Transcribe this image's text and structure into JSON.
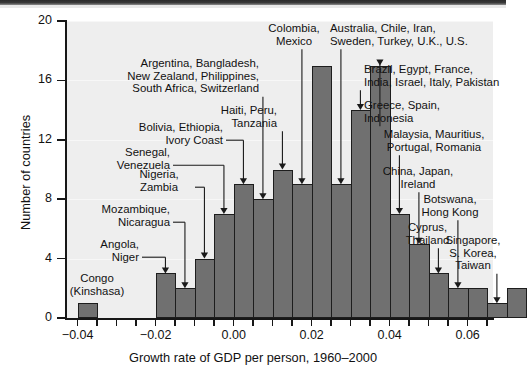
{
  "chart_data": {
    "type": "bar",
    "title": "",
    "xlabel": "Growth rate of GDP per person, 1960–2000",
    "ylabel": "Number of countries",
    "xlim": [
      -0.043,
      0.0665
    ],
    "ylim": [
      0,
      20
    ],
    "grid": false,
    "bin_width": 0.005,
    "x_ticks": [
      -0.04,
      -0.035,
      -0.03,
      -0.025,
      -0.02,
      -0.015,
      -0.01,
      -0.005,
      0.0,
      0.005,
      0.01,
      0.015,
      0.02,
      0.025,
      0.03,
      0.035,
      0.04,
      0.045,
      0.05,
      0.055,
      0.06,
      0.065
    ],
    "x_tick_labels": [
      "-0.04",
      "",
      "",
      "",
      "-0.02",
      "",
      "",
      "",
      "0.00",
      "",
      "",
      "",
      "0.02",
      "",
      "",
      "",
      "0.04",
      "",
      "",
      "",
      "0.06",
      ""
    ],
    "y_ticks": [
      0,
      4,
      8,
      12,
      16,
      20
    ],
    "y_tick_labels": [
      "0",
      "4",
      "8",
      "12",
      "16",
      "20"
    ],
    "bins": [
      {
        "x0": -0.04,
        "x1": -0.035,
        "value": 1
      },
      {
        "x0": -0.035,
        "x1": -0.03,
        "value": 0
      },
      {
        "x0": -0.03,
        "x1": -0.025,
        "value": 0
      },
      {
        "x0": -0.025,
        "x1": -0.02,
        "value": 0
      },
      {
        "x0": -0.02,
        "x1": -0.015,
        "value": 3
      },
      {
        "x0": -0.015,
        "x1": -0.01,
        "value": 2
      },
      {
        "x0": -0.01,
        "x1": -0.005,
        "value": 4
      },
      {
        "x0": -0.005,
        "x1": 0.0,
        "value": 7
      },
      {
        "x0": 0.0,
        "x1": 0.005,
        "value": 9
      },
      {
        "x0": 0.005,
        "x1": 0.01,
        "value": 8
      },
      {
        "x0": 0.01,
        "x1": 0.015,
        "value": 10
      },
      {
        "x0": 0.015,
        "x1": 0.02,
        "value": 9
      },
      {
        "x0": 0.02,
        "x1": 0.025,
        "value": 17
      },
      {
        "x0": 0.025,
        "x1": 0.03,
        "value": 9
      },
      {
        "x0": 0.03,
        "x1": 0.035,
        "value": 14
      },
      {
        "x0": 0.035,
        "x1": 0.04,
        "value": 17
      },
      {
        "x0": 0.04,
        "x1": 0.045,
        "value": 7
      },
      {
        "x0": 0.045,
        "x1": 0.05,
        "value": 5
      },
      {
        "x0": 0.05,
        "x1": 0.055,
        "value": 3
      },
      {
        "x0": 0.055,
        "x1": 0.06,
        "value": 2
      },
      {
        "x0": 0.06,
        "x1": 0.065,
        "value": 2
      },
      {
        "x0": 0.065,
        "x1": 0.07,
        "value": 1
      },
      {
        "x0": 0.07,
        "x1": 0.075,
        "value": 2
      }
    ],
    "annotations": [
      {
        "id": "congo",
        "text": "Congo\n(Kinshasa)",
        "bin": 0
      },
      {
        "id": "angola",
        "text": "Angola,\nNiger",
        "bin": 4
      },
      {
        "id": "mozambique",
        "text": "Mozambique,\nNicaragua",
        "bin": 5
      },
      {
        "id": "nigeria",
        "text": "Nigeria,\nZambia",
        "bin": 6
      },
      {
        "id": "senegal",
        "text": "Senegal,\nVenezuela",
        "bin": 7
      },
      {
        "id": "bolivia",
        "text": "Bolivia, Ethiopia,\nIvory Coast",
        "bin": 8
      },
      {
        "id": "argentina",
        "text": "Argentina, Bangladesh,\nNew Zealand, Philippines,\nSouth Africa, Switzerland",
        "bin": 9
      },
      {
        "id": "haiti",
        "text": "Haiti, Peru,\nTanzania",
        "bin": 10
      },
      {
        "id": "colombia",
        "text": "Colombia,\nMexico",
        "bin": 11
      },
      {
        "id": "australia",
        "text": "Australia, Chile, Iran,\nSweden, Turkey, U.K., U.S.",
        "bin": 13
      },
      {
        "id": "brazil",
        "text": "Brazil, Egypt, France,\nIndia, Israel, Italy, Pakistan",
        "bin": 14
      },
      {
        "id": "greece",
        "text": "Greece, Spain,\nIndonesia",
        "bin": 15
      },
      {
        "id": "malaysia",
        "text": "Malaysia, Mauritius,\nPortugal, Romania",
        "bin": 16
      },
      {
        "id": "china",
        "text": "China, Japan,\nIreland",
        "bin": 17
      },
      {
        "id": "cyprus",
        "text": "Cyprus,\nThailand",
        "bin": 18
      },
      {
        "id": "botswana",
        "text": "Botswana,\nHong Kong",
        "bin": 19
      },
      {
        "id": "singapore",
        "text": "Singapore,\nS. Korea,\nTaiwan",
        "bin": 21
      }
    ]
  },
  "colors": {
    "bar_fill": "#707070",
    "bar_edge": "#1d1d1d",
    "plot_background": "#eeeeee",
    "axis": "#171717",
    "text": "#111111"
  }
}
